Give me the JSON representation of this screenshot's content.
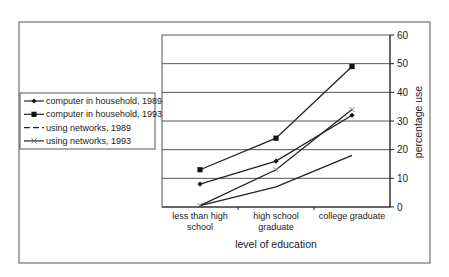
{
  "chart_data": {
    "type": "line",
    "title": "",
    "categories": [
      "less than high school",
      "high school graduate",
      "college graduate"
    ],
    "category_lines": [
      [
        "less than high",
        "school"
      ],
      [
        "high school",
        "graduate"
      ],
      [
        "college graduate"
      ]
    ],
    "xlabel": "level of education",
    "ylabel": "percentage use",
    "ylim": [
      0,
      60
    ],
    "yticks": [
      0,
      10,
      20,
      30,
      40,
      50,
      60
    ],
    "y_axis_position": "right",
    "grid": true,
    "legend_position": "left",
    "series": [
      {
        "name": "computer in household, 1989",
        "marker": "diamond",
        "dash": "solid",
        "values": [
          8,
          16,
          32
        ]
      },
      {
        "name": "computer in household, 1993",
        "marker": "square",
        "dash": "solid",
        "values": [
          13,
          24,
          49
        ]
      },
      {
        "name": "using networks, 1989",
        "marker": "none",
        "dash": "dashed",
        "values": [
          0.5,
          7,
          18
        ]
      },
      {
        "name": "using networks, 1993",
        "marker": "cross",
        "dash": "solid",
        "values": [
          0.5,
          13,
          34
        ]
      }
    ]
  },
  "colors": {
    "line": "#222222",
    "grid": "#444444",
    "frame": "#555555"
  }
}
